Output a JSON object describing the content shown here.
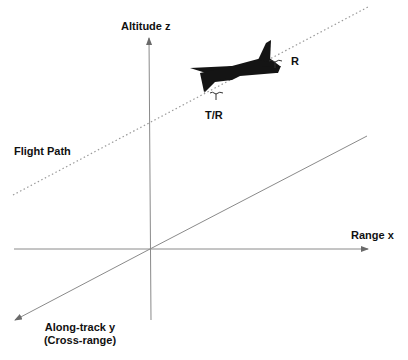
{
  "diagram": {
    "labels": {
      "altitude": "Altitude  z",
      "range": "Range  x",
      "along_track": "Along-track  y",
      "cross_range": "(Cross-range)",
      "flight_path": "Flight Path",
      "receiver": "R",
      "transmit_receive": "T/R"
    },
    "colors": {
      "axis": "#8a8a8a",
      "flight_path": "#9a9a9a",
      "aircraft": "#141414",
      "text": "#111111"
    },
    "icons": {
      "aircraft": "airplane-icon",
      "antenna_tr": "antenna-icon",
      "antenna_r": "antenna-icon"
    }
  }
}
